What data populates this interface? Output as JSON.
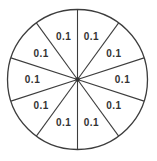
{
  "chart_data": {
    "type": "pie",
    "title": "",
    "xlabel": "",
    "ylabel": "",
    "legend": "none",
    "categories": [
      "sector-1",
      "sector-2",
      "sector-3",
      "sector-4",
      "sector-5",
      "sector-6",
      "sector-7",
      "sector-8",
      "sector-9",
      "sector-10"
    ],
    "values": [
      0.1,
      0.1,
      0.1,
      0.1,
      0.1,
      0.1,
      0.1,
      0.1,
      0.1,
      0.1
    ],
    "labels": [
      "0.1",
      "0.1",
      "0.1",
      "0.1",
      "0.1",
      "0.1",
      "0.1",
      "0.1",
      "0.1",
      "0.1"
    ],
    "total": 1.0,
    "annotation": "Circle divided into 10 equal sectors, each labeled 0.1; radial divider lines meet at a small center dot",
    "colors": {
      "background": "#ffffff",
      "sector_fill": "#ffffff",
      "line_stroke": "#3d3d3d",
      "label_text": "#333333",
      "center_dot": "#333333"
    }
  }
}
